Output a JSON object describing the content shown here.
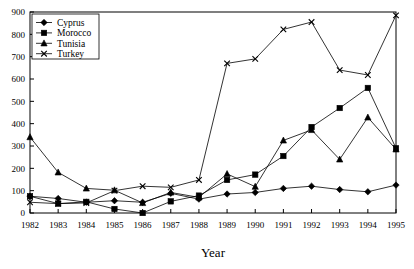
{
  "chart_data": {
    "type": "line",
    "title": "",
    "xlabel": "Year",
    "ylabel": "",
    "xlim": [
      1982,
      1995
    ],
    "ylim": [
      0,
      900
    ],
    "ytick_step": 100,
    "grid": false,
    "legend_position": "top-left",
    "categories": [
      "1982",
      "1983",
      "1984",
      "1985",
      "1986",
      "1987",
      "1988",
      "1989",
      "1990",
      "1991",
      "1992",
      "1993",
      "1994",
      "1995"
    ],
    "x": [
      1982,
      1983,
      1984,
      1985,
      1986,
      1987,
      1988,
      1989,
      1990,
      1991,
      1992,
      1993,
      1994,
      1995
    ],
    "yticks": [
      "0",
      "100",
      "200",
      "300",
      "400",
      "500",
      "600",
      "700",
      "800",
      "900"
    ],
    "series": [
      {
        "name": "Cyprus",
        "marker": "diamond",
        "values": [
          75,
          65,
          48,
          55,
          48,
          88,
          62,
          85,
          92,
          110,
          120,
          105,
          95,
          125
        ]
      },
      {
        "name": "Morocco",
        "marker": "square",
        "values": [
          75,
          42,
          50,
          18,
          0,
          52,
          78,
          148,
          172,
          255,
          385,
          470,
          560,
          290
        ]
      },
      {
        "name": "Tunisia",
        "marker": "triangle",
        "values": [
          340,
          182,
          110,
          102,
          45,
          92,
          70,
          175,
          118,
          325,
          372,
          240,
          428,
          285
        ]
      },
      {
        "name": "Turkey",
        "marker": "x",
        "values": [
          48,
          42,
          45,
          100,
          120,
          115,
          148,
          670,
          690,
          822,
          855,
          640,
          618,
          885
        ]
      }
    ]
  },
  "legend": {
    "items": [
      {
        "label": "Cyprus"
      },
      {
        "label": "Morocco"
      },
      {
        "label": "Tunisia"
      },
      {
        "label": "Turkey"
      }
    ]
  },
  "axis": {
    "x_title": "Year"
  },
  "colors": {
    "line": "#000000",
    "frame": "#000000",
    "background": "#ffffff"
  }
}
